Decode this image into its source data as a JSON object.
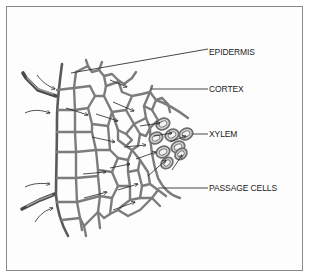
{
  "diagram": {
    "labels": [
      {
        "id": "epidermis",
        "text": "EPIDERMIS"
      },
      {
        "id": "cortex",
        "text": "CORTEX"
      },
      {
        "id": "xylem",
        "text": "XYLEM"
      },
      {
        "id": "passage-cells",
        "text": "PASSAGE CELLS"
      }
    ],
    "colors": {
      "cell_wall": "#7c7c7c",
      "epidermis_wall": "#5a5a5a",
      "root_hair": "#4a4a4a",
      "xylem_fill": "#d8d8d8",
      "arrow": "#222222",
      "frame": "#8a8a8a"
    }
  }
}
